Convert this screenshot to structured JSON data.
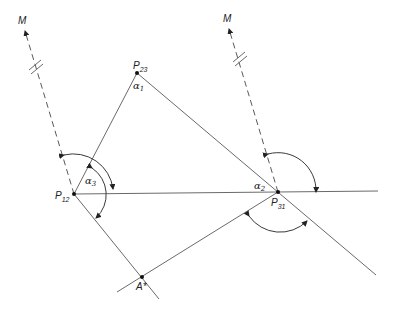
{
  "diagram": {
    "type": "geometric-construction",
    "points": [
      {
        "id": "P12",
        "label": "P",
        "sub": "12",
        "x": 74,
        "y": 194
      },
      {
        "id": "P23",
        "label": "P",
        "sub": "23",
        "x": 137,
        "y": 73
      },
      {
        "id": "P31",
        "label": "P",
        "sub": "31",
        "x": 278,
        "y": 192
      },
      {
        "id": "Astar",
        "label": "A*",
        "x": 142,
        "y": 277
      }
    ],
    "labels": {
      "m_left": "M",
      "m_right": "M",
      "p12": "P",
      "p12_sub": "12",
      "p23": "P",
      "p23_sub": "23",
      "p31": "P",
      "p31_sub": "31",
      "astar": "A*",
      "alpha1": "α",
      "alpha1_sub": "1",
      "alpha2": "α",
      "alpha2_sub": "2",
      "alpha3": "α",
      "alpha3_sub": "3"
    },
    "lines": [
      {
        "name": "P12-P23",
        "from": "P12",
        "to": "P23"
      },
      {
        "name": "P23-P31-extended",
        "from": "P23",
        "to": "lower-right"
      },
      {
        "name": "P12-P31-horizontal",
        "from": "P12",
        "to": "right-edge"
      },
      {
        "name": "P12-Astar-extended",
        "from": "P12",
        "to": "below-Astar"
      },
      {
        "name": "Astar-P31",
        "from": "lower-left",
        "to": "P31"
      },
      {
        "name": "M-P12-dashed",
        "style": "dashed",
        "from": "P12",
        "to": "M"
      },
      {
        "name": "M-P31-dashed",
        "style": "dashed",
        "from": "P31",
        "to": "M"
      }
    ],
    "angle_arcs": 4
  }
}
